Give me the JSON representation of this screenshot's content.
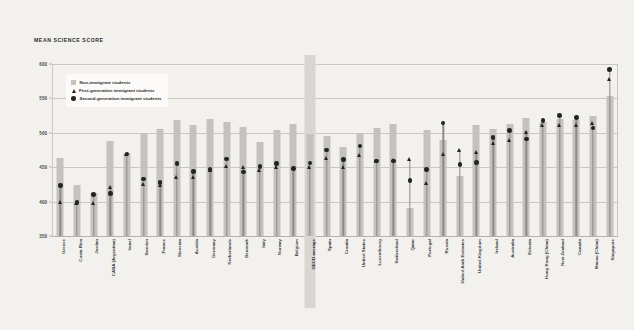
{
  "chart_data": {
    "type": "bar",
    "title": "MEAN SCIENCE SCORE",
    "xlabel": "",
    "ylabel": "",
    "ylim": [
      350,
      600
    ],
    "yticks": [
      350,
      400,
      450,
      500,
      550,
      600
    ],
    "grid": true,
    "legend_position": "top-left",
    "highlight_category": "OECD average",
    "categories": [
      "Greece",
      "Costa Rica",
      "Jordan",
      "CABA (Argentina)",
      "Israel",
      "Sweden",
      "France",
      "Slovenia",
      "Austria",
      "Germany",
      "Netherlands",
      "Denmark",
      "Italy",
      "Norway",
      "Belgium",
      "OECD average",
      "Spain",
      "Croatia",
      "United States",
      "Luxembourg",
      "Switzerland",
      "Qatar",
      "Portugal",
      "Russia",
      "United Arab Emirates",
      "United Kingdom",
      "Ireland",
      "Australia",
      "Estonia",
      "Hong Kong (China)",
      "New Zealand",
      "Canada",
      "Macao (China)",
      "Singapore"
    ],
    "series": [
      {
        "name": "Non-immigrant students",
        "marker": "bar",
        "values": [
          463,
          424,
          412,
          488,
          470,
          500,
          505,
          519,
          512,
          520,
          516,
          508,
          487,
          504,
          513,
          499,
          496,
          479,
          500,
          507,
          513,
          390,
          504,
          489,
          437,
          511,
          506,
          513,
          522,
          516,
          520,
          519,
          524,
          554
        ]
      },
      {
        "name": "First-generation immigrant students",
        "marker": "triangle",
        "values": [
          399,
          398,
          398,
          422,
          469,
          426,
          425,
          436,
          436,
          446,
          452,
          450,
          446,
          450,
          449,
          451,
          464,
          450,
          468,
          460,
          461,
          462,
          428,
          470,
          476,
          472,
          486,
          490,
          502,
          512,
          512,
          511,
          514,
          578
        ]
      },
      {
        "name": "Second-generation immigrant students",
        "marker": "circle",
        "values": [
          423,
          399,
          410,
          412,
          469,
          433,
          428,
          455,
          444,
          447,
          462,
          443,
          451,
          455,
          448,
          456,
          475,
          461,
          481,
          459,
          459,
          431,
          447,
          514,
          454,
          457,
          493,
          503,
          491,
          518,
          525,
          522,
          507,
          592
        ]
      }
    ]
  },
  "legend": {
    "items": [
      {
        "label": "Non-immigrant students",
        "marker": "square"
      },
      {
        "label": "First-generation immigrant students",
        "marker": "triangle"
      },
      {
        "label": "Second-generation immigrant students",
        "marker": "circle"
      }
    ]
  },
  "colors": {
    "background": "#f2f1ee",
    "bar": "#c4c2bd",
    "marker": "#232323",
    "stem": "#8d8b86",
    "grid": "#c9c7c2",
    "highlight_band": "#d8d6d1"
  }
}
